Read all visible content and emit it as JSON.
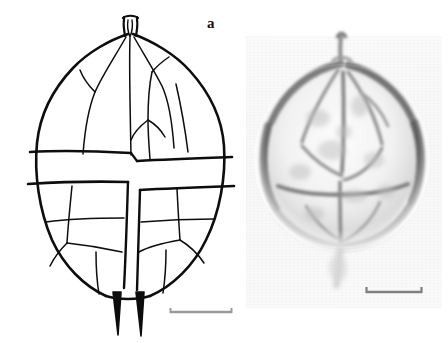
{
  "figure": {
    "type": "two-panel scientific plate",
    "background_color": "#ffffff",
    "width": 448,
    "height": 343
  },
  "panels": [
    {
      "id": "a",
      "label": "a",
      "kind": "line-drawing",
      "description": "ink line drawing of thecal plate tabulation in ventral view",
      "ink_color": "#0d0d0d",
      "features": {
        "apical_horn": "short apical pore complex / horn at cell apex",
        "epitheca": "upper half divided into radiating apical and precingular plates",
        "cingulum": "horizontal equatorial girdle band crossing entire cell",
        "sulcus": "vertical longitudinal furrow descending from cingulum to antapex",
        "hypotheca": "lower half divided into postcingular and antapical plates",
        "antapical_spines": "two slender antapical spines"
      },
      "scale_bar": {
        "present": true,
        "style": "plain bar with end serifs",
        "color": "#9a9a9a",
        "caption": ""
      }
    },
    {
      "id": "b",
      "label": "b",
      "kind": "photomicrograph",
      "description": "light micrograph of the same dinoflagellate cell, grayscale",
      "cell_outline": "near-circular theca with dark gray rim",
      "visible_details": "internal plate sutures, apical horn, equatorial cingulum, faint trailing flagellum",
      "background_color": "#f8f8f8",
      "scale_bar": {
        "present": true,
        "style": "plain bar with end serifs",
        "color": "#7f7f7f",
        "caption": ""
      }
    }
  ]
}
